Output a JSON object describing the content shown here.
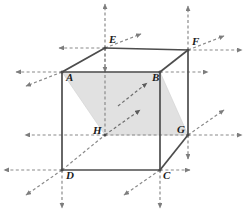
{
  "figure": {
    "name": "cube-with-shaded-diagonal-plane",
    "background_color": "#ffffff",
    "solid_edge_color": "#4d4d4d",
    "dashed_line_color": "#8a8a8a",
    "shade_fill_color": "#dcdcdc",
    "shade_stroke_color": "#d0d0d0",
    "label_color": "#1c1c1c"
  },
  "vertices": [
    {
      "id": "E",
      "label": "E",
      "x": 105,
      "y": 48,
      "label_x": 109,
      "label_y": 34
    },
    {
      "id": "F",
      "label": "F",
      "x": 188,
      "y": 50,
      "label_x": 192,
      "label_y": 36
    },
    {
      "id": "A",
      "label": "A",
      "x": 62,
      "y": 72,
      "label_x": 66,
      "label_y": 72
    },
    {
      "id": "B",
      "label": "B",
      "x": 160,
      "y": 72,
      "label_x": 152,
      "label_y": 72
    },
    {
      "id": "H",
      "label": "H",
      "x": 105,
      "y": 135,
      "label_x": 93,
      "label_y": 125
    },
    {
      "id": "G",
      "label": "G",
      "x": 188,
      "y": 135,
      "label_x": 177,
      "label_y": 124
    },
    {
      "id": "D",
      "label": "D",
      "x": 62,
      "y": 170,
      "label_x": 66,
      "label_y": 170
    },
    {
      "id": "C",
      "label": "C",
      "x": 160,
      "y": 170,
      "label_x": 163,
      "label_y": 170
    }
  ],
  "solid_edges": [
    {
      "name": "edge-A-B",
      "from": "A",
      "to": "B"
    },
    {
      "name": "edge-A-D",
      "from": "A",
      "to": "D"
    },
    {
      "name": "edge-B-C",
      "from": "B",
      "to": "C"
    },
    {
      "name": "edge-D-C",
      "from": "D",
      "to": "C"
    },
    {
      "name": "edge-E-F",
      "from": "E",
      "to": "F"
    },
    {
      "name": "edge-A-E",
      "from": "A",
      "to": "E"
    },
    {
      "name": "edge-B-F",
      "from": "B",
      "to": "F"
    },
    {
      "name": "edge-F-G",
      "from": "F",
      "to": "G"
    },
    {
      "name": "edge-C-G",
      "from": "C",
      "to": "G"
    }
  ],
  "dashed_edges": [
    {
      "name": "hidden-edge-E-H",
      "from": "E",
      "to": "H"
    },
    {
      "name": "hidden-edge-H-G",
      "from": "H",
      "to": "G"
    },
    {
      "name": "hidden-edge-D-H",
      "from": "D",
      "to": "H"
    }
  ],
  "shaded_plane": {
    "name": "shaded-parallelogram-section",
    "points": "62,72 160,72 188,135 105,135",
    "opacity": 0.85
  },
  "inner_arrows": [
    {
      "name": "inner-arrow-upper-right",
      "x1": 118,
      "y1": 106,
      "x2": 147,
      "y2": 83
    },
    {
      "name": "inner-arrow-lower-right",
      "x1": 105,
      "y1": 135,
      "x2": 140,
      "y2": 110
    }
  ],
  "vertex_rays": [
    {
      "name": "ray-E-up",
      "vertex": "E",
      "dx": 0,
      "dy": -44
    },
    {
      "name": "ray-E-down",
      "vertex": "E",
      "dx": 0,
      "dy": 24
    },
    {
      "name": "ray-E-left",
      "vertex": "E",
      "dx": -46,
      "dy": 0
    },
    {
      "name": "ray-E-diag-up",
      "vertex": "E",
      "dx": 36,
      "dy": -14
    },
    {
      "name": "ray-F-up",
      "vertex": "F",
      "dx": 0,
      "dy": -44
    },
    {
      "name": "ray-F-right",
      "vertex": "F",
      "dx": 54,
      "dy": 0
    },
    {
      "name": "ray-F-diag-up",
      "vertex": "F",
      "dx": 36,
      "dy": -14
    },
    {
      "name": "ray-A-left",
      "vertex": "A",
      "dx": -46,
      "dy": 0
    },
    {
      "name": "ray-A-diag-down",
      "vertex": "A",
      "dx": -36,
      "dy": 14
    },
    {
      "name": "ray-B-right",
      "vertex": "B",
      "dx": 48,
      "dy": 0
    },
    {
      "name": "ray-H-left",
      "vertex": "H",
      "dx": -80,
      "dy": 0
    },
    {
      "name": "ray-G-right",
      "vertex": "G",
      "dx": 54,
      "dy": 0
    },
    {
      "name": "ray-G-diag-up",
      "vertex": "G",
      "dx": 36,
      "dy": -25
    },
    {
      "name": "ray-G-down",
      "vertex": "G",
      "dx": 0,
      "dy": 24
    },
    {
      "name": "ray-D-left",
      "vertex": "D",
      "dx": -58,
      "dy": 0
    },
    {
      "name": "ray-D-down",
      "vertex": "D",
      "dx": 0,
      "dy": 38
    },
    {
      "name": "ray-D-diag-down",
      "vertex": "D",
      "dx": -36,
      "dy": 25
    },
    {
      "name": "ray-C-right",
      "vertex": "C",
      "dx": 30,
      "dy": 0
    },
    {
      "name": "ray-C-down",
      "vertex": "C",
      "dx": 0,
      "dy": 38
    },
    {
      "name": "ray-C-diag-down",
      "vertex": "C",
      "dx": -36,
      "dy": 25
    }
  ]
}
